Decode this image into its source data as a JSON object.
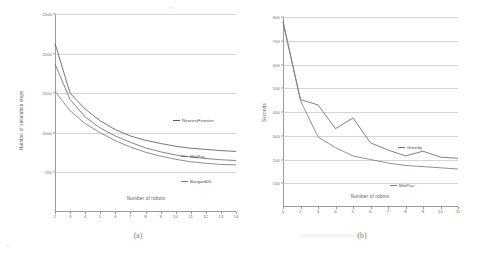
{
  "figure": {
    "caption_a": "(a)",
    "caption_b": "(b)"
  },
  "chart_data": [
    {
      "id": "a",
      "type": "line",
      "title": "",
      "xlabel": "Number of robots",
      "ylabel": "Number of simulation steps",
      "x": [
        2,
        3,
        4,
        5,
        6,
        7,
        8,
        9,
        10,
        11,
        12,
        13,
        14
      ],
      "xticklabels": [
        "2",
        "3",
        "4",
        "5",
        "6",
        "7",
        "8",
        "9",
        "10",
        "11",
        "12",
        "13",
        "14"
      ],
      "yticklabels": [
        "2500",
        "2000",
        "1500",
        "1000",
        "500"
      ],
      "yticks": [
        2500,
        2000,
        1500,
        1000,
        500
      ],
      "xlim": [
        2,
        14
      ],
      "ylim": [
        0,
        2500
      ],
      "grid": true,
      "legend_position": "inside-right",
      "series": [
        {
          "name": "NearestFrontier",
          "color": "#5d5d5d",
          "values": [
            2130,
            1500,
            1300,
            1150,
            1040,
            960,
            905,
            865,
            830,
            805,
            790,
            775,
            765
          ]
        },
        {
          "name": "MinPos",
          "color": "#6f6f6f",
          "values": [
            1870,
            1420,
            1200,
            1060,
            960,
            880,
            810,
            760,
            720,
            695,
            675,
            660,
            650
          ]
        },
        {
          "name": "Burgard05",
          "color": "#7b7b7b",
          "values": [
            1520,
            1280,
            1115,
            1000,
            900,
            820,
            755,
            705,
            665,
            635,
            615,
            600,
            595
          ]
        }
      ]
    },
    {
      "id": "b",
      "type": "line",
      "title": "",
      "xlabel": "Number of robots",
      "ylabel": "Seconds",
      "x": [
        1,
        2,
        3,
        4,
        5,
        6,
        7,
        8,
        9,
        10,
        11
      ],
      "xticklabels": [
        "1",
        "2",
        "3",
        "4",
        "5",
        "6",
        "7",
        "8",
        "9",
        "10",
        "11"
      ],
      "yticklabels": [
        "800",
        "700",
        "600",
        "500",
        "400",
        "300",
        "200",
        "100"
      ],
      "yticks": [
        800,
        700,
        600,
        500,
        400,
        300,
        200,
        100
      ],
      "xlim": [
        1,
        11
      ],
      "ylim": [
        0,
        800
      ],
      "grid": true,
      "legend_position": "inside-right",
      "series": [
        {
          "name": "Greedy",
          "color": "#6a6a6a",
          "values": [
            780,
            452,
            430,
            330,
            375,
            270,
            240,
            215,
            235,
            210,
            205
          ]
        },
        {
          "name": "MinPos",
          "color": "#7d7d7d",
          "values": [
            780,
            448,
            295,
            250,
            215,
            200,
            185,
            175,
            170,
            165,
            160
          ]
        }
      ]
    }
  ]
}
